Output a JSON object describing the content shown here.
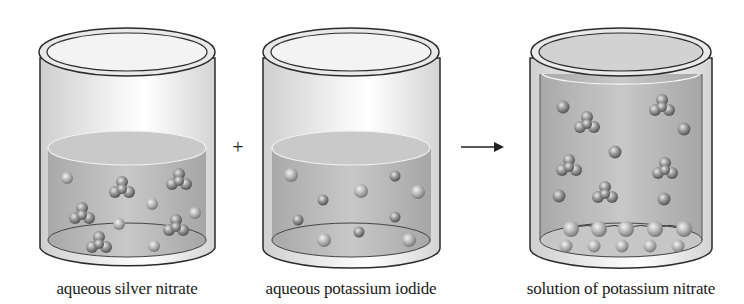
{
  "figure": {
    "operators": {
      "plus": "+",
      "arrow": "→"
    },
    "beakers": [
      {
        "id": "silver-nitrate",
        "label": "aqueous silver nitrate",
        "fill_level": "half",
        "single_ions": 5,
        "trigonal_clusters": 6
      },
      {
        "id": "potassium-iodide",
        "label": "aqueous potassium iodide",
        "fill_level": "half",
        "single_ions": 10,
        "trigonal_clusters": 0
      },
      {
        "id": "potassium-nitrate",
        "label": "solution of potassium nitrate",
        "fill_level": "full",
        "single_ions": 6,
        "trigonal_clusters": 6,
        "precipitate_particles": 10
      }
    ]
  },
  "colors": {
    "glass_outline": "#2a2a2a",
    "liquid": "#b9b9b9",
    "glass_body": "#e6e6e6",
    "particle": "#8a8a8a"
  }
}
